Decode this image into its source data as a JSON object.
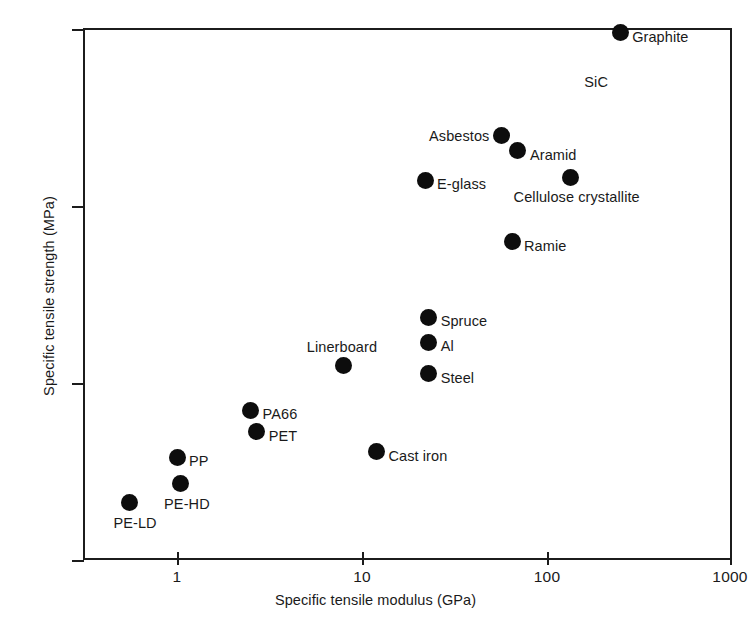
{
  "chart": {
    "type": "scatter",
    "title": "",
    "xlabel": "Specific tensile modulus (GPa)",
    "ylabel": "Specific tensile strength (MPa)",
    "xscale": "log",
    "yscale": "log",
    "xlim": [
      0.5,
      1000
    ],
    "ylim": [
      10,
      10000
    ],
    "xticks": [
      "1",
      "10",
      "100",
      "1000"
    ],
    "yticks": [
      "10",
      "100",
      "1000",
      "10000"
    ],
    "grid": false,
    "legend": false,
    "marker_color": "#0d0d0d",
    "axis_color": "#1c1c1c"
  },
  "chart_data": {
    "type": "scatter",
    "title": "",
    "xlabel": "Specific tensile modulus (GPa)",
    "ylabel": "Specific tensile strength (MPa)",
    "xscale": "log",
    "yscale": "log",
    "xlim": [
      0.5,
      1000
    ],
    "ylim": [
      10,
      10000
    ],
    "xtick_values": [
      1,
      10,
      100,
      1000
    ],
    "xtick_labels": [
      "1",
      "10",
      "100",
      "1000"
    ],
    "ytick_values": [
      10,
      100,
      1000,
      10000
    ],
    "ytick_labels": [
      "10",
      "100",
      "1000",
      "10000"
    ],
    "grid": false,
    "legend": null,
    "points": [
      {
        "label": "PE-LD",
        "x": 0.55,
        "y": 21,
        "label_pos": "below"
      },
      {
        "label": "PE-HD",
        "x": 1.05,
        "y": 27,
        "label_pos": "below"
      },
      {
        "label": "PP",
        "x": 1.0,
        "y": 38,
        "label_pos": "right"
      },
      {
        "label": "PET",
        "x": 2.7,
        "y": 53,
        "label_pos": "right"
      },
      {
        "label": "PA66",
        "x": 2.5,
        "y": 70,
        "label_pos": "right"
      },
      {
        "label": "Cast iron",
        "x": 12,
        "y": 41,
        "label_pos": "right"
      },
      {
        "label": "Linerboard",
        "x": 8,
        "y": 125,
        "label_pos": "above"
      },
      {
        "label": "Steel",
        "x": 23,
        "y": 113,
        "label_pos": "right"
      },
      {
        "label": "Al",
        "x": 23,
        "y": 170,
        "label_pos": "right"
      },
      {
        "label": "Spruce",
        "x": 23,
        "y": 235,
        "label_pos": "right"
      },
      {
        "label": "Ramie",
        "x": 65,
        "y": 630,
        "label_pos": "right"
      },
      {
        "label": "E-glass",
        "x": 22,
        "y": 1400,
        "label_pos": "right"
      },
      {
        "label": "Cellulose crystallite",
        "x": 135,
        "y": 1450,
        "label_pos": "below"
      },
      {
        "label": "Aramid",
        "x": 70,
        "y": 2050,
        "label_pos": "right"
      },
      {
        "label": "Asbestos",
        "x": 57,
        "y": 2500,
        "label_pos": "left"
      },
      {
        "label": "Graphite",
        "x": 250,
        "y": 9500,
        "label_pos": "right"
      }
    ],
    "annotations": [
      {
        "text": "SiC",
        "x": 160,
        "y": 5000,
        "note": "label for the same uppermost marker as Graphite"
      }
    ]
  }
}
